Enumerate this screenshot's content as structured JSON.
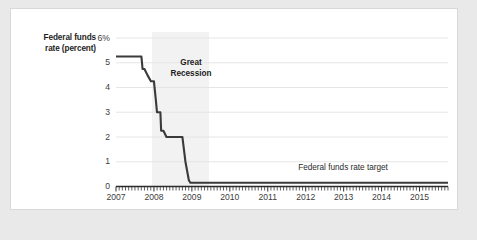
{
  "figure": {
    "background_color": "#e9e9e9",
    "card_color": "#ffffff",
    "line_color": "#3a3a3a",
    "grid_color": "#e2e2e2",
    "axis_color": "#2b2b2b",
    "recession_band_color": "#f2f2f2"
  },
  "chart_data": {
    "type": "line",
    "title": "",
    "xlabel": "",
    "ylabel": "Federal funds rate (percent)",
    "ylabel_lines": [
      "Federal funds",
      "rate (percent)"
    ],
    "ylim": [
      0,
      6
    ],
    "xlim": [
      2007,
      2015.75
    ],
    "grid": true,
    "legend": "none",
    "y_ticks": [
      0,
      1,
      2,
      3,
      4,
      5,
      6
    ],
    "y_tick_labels": [
      "0",
      "1",
      "2",
      "3",
      "4",
      "5",
      "6%"
    ],
    "x_ticks": [
      2007,
      2008,
      2009,
      2010,
      2011,
      2012,
      2013,
      2014,
      2015
    ],
    "x_tick_labels": [
      "2007",
      "2008",
      "2009",
      "2010",
      "2011",
      "2012",
      "2013",
      "2014",
      "2015"
    ],
    "minor_x_tick_interval_months": 1,
    "annotations": [
      {
        "text": "Great Recession",
        "lines": [
          "Great",
          "Recession"
        ],
        "x": 2008.6,
        "y": 4.9,
        "bold": true
      },
      {
        "text": "Federal funds rate target",
        "x": 2013.1,
        "y": 0.85,
        "bold": false
      }
    ],
    "shaded_regions": [
      {
        "label": "Great Recession",
        "x_start": 2007.95,
        "x_end": 2009.45,
        "color": "#f2f2f2"
      }
    ],
    "series": [
      {
        "name": "Federal funds rate",
        "color": "#3a3a3a",
        "x": [
          2007.0,
          2007.08,
          2007.17,
          2007.25,
          2007.33,
          2007.42,
          2007.5,
          2007.58,
          2007.67,
          2007.7,
          2007.75,
          2007.83,
          2007.92,
          2008.0,
          2008.05,
          2008.08,
          2008.17,
          2008.19,
          2008.25,
          2008.33,
          2008.42,
          2008.5,
          2008.58,
          2008.67,
          2008.75,
          2008.79,
          2008.83,
          2008.92,
          2008.96,
          2009.0,
          2009.25,
          2009.5,
          2010.0,
          2010.5,
          2011.0,
          2011.5,
          2012.0,
          2012.5,
          2013.0,
          2013.5,
          2014.0,
          2014.5,
          2015.0,
          2015.5,
          2015.75
        ],
        "y": [
          5.25,
          5.25,
          5.25,
          5.25,
          5.25,
          5.25,
          5.25,
          5.25,
          5.25,
          4.75,
          4.75,
          4.5,
          4.25,
          4.25,
          3.5,
          3.0,
          3.0,
          2.25,
          2.25,
          2.0,
          2.0,
          2.0,
          2.0,
          2.0,
          2.0,
          1.5,
          1.0,
          0.25,
          0.15,
          0.15,
          0.15,
          0.15,
          0.15,
          0.15,
          0.15,
          0.15,
          0.15,
          0.15,
          0.15,
          0.15,
          0.15,
          0.15,
          0.15,
          0.15,
          0.15
        ]
      }
    ]
  }
}
